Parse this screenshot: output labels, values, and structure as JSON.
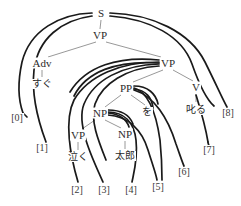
{
  "diagram": {
    "canvas": {
      "width": 241,
      "height": 206
    },
    "colors": {
      "background": "#ffffff",
      "tree_edge": "#8c8c8c",
      "arc": "#1a1a1a",
      "text": "#2b2b2b"
    }
  },
  "nodes": {
    "s": {
      "label": "S",
      "x": 101,
      "y": 13,
      "kind": "category"
    },
    "vp_top": {
      "label": "VP",
      "x": 100,
      "y": 35,
      "kind": "category"
    },
    "adv": {
      "label": "Adv",
      "x": 42,
      "y": 63,
      "kind": "category"
    },
    "vp_right": {
      "label": "VP",
      "x": 168,
      "y": 63,
      "kind": "category"
    },
    "sugu": {
      "label": "すぐ",
      "x": 42,
      "y": 84,
      "kind": "word"
    },
    "v": {
      "label": "V",
      "x": 196,
      "y": 87,
      "kind": "category"
    },
    "pp": {
      "label": "PP",
      "x": 126,
      "y": 88,
      "kind": "category"
    },
    "shikaru": {
      "label": "叱る",
      "x": 196,
      "y": 110,
      "kind": "word"
    },
    "wo": {
      "label": "を",
      "x": 147,
      "y": 112,
      "kind": "word"
    },
    "np_upper": {
      "label": "NP",
      "x": 100,
      "y": 113,
      "kind": "category"
    },
    "vp_low": {
      "label": "VP",
      "x": 78,
      "y": 135,
      "kind": "category"
    },
    "np_lower": {
      "label": "NP",
      "x": 125,
      "y": 134,
      "kind": "category"
    },
    "naku": {
      "label": "泣く",
      "x": 78,
      "y": 157,
      "kind": "word"
    },
    "taro": {
      "label": "太郎",
      "x": 125,
      "y": 156,
      "kind": "word"
    }
  },
  "indices": [
    {
      "label": "[0]",
      "x": 17,
      "y": 118
    },
    {
      "label": "[1]",
      "x": 42,
      "y": 148
    },
    {
      "label": "[2]",
      "x": 77,
      "y": 190
    },
    {
      "label": "[3]",
      "x": 104,
      "y": 190
    },
    {
      "label": "[4]",
      "x": 131,
      "y": 190
    },
    {
      "label": "[5]",
      "x": 158,
      "y": 187
    },
    {
      "label": "[6]",
      "x": 184,
      "y": 172
    },
    {
      "label": "[7]",
      "x": 209,
      "y": 150
    },
    {
      "label": "[8]",
      "x": 228,
      "y": 113
    }
  ],
  "tree_edges": [
    {
      "from": "s",
      "to": "vp_top"
    },
    {
      "from": "vp_top",
      "to": "adv"
    },
    {
      "from": "vp_top",
      "to": "vp_right"
    },
    {
      "from": "adv",
      "to": "sugu"
    },
    {
      "from": "vp_right",
      "to": "pp"
    },
    {
      "from": "vp_right",
      "to": "v"
    },
    {
      "from": "v",
      "to": "shikaru"
    },
    {
      "from": "pp",
      "to": "np_upper"
    },
    {
      "from": "pp",
      "to": "wo"
    },
    {
      "from": "np_upper",
      "to": "vp_low"
    },
    {
      "from": "np_upper",
      "to": "np_lower"
    },
    {
      "from": "vp_low",
      "to": "naku"
    },
    {
      "from": "np_lower",
      "to": "taro"
    }
  ],
  "arcs": [
    {
      "name": "arc-s-0",
      "from_node": "s",
      "to_index": "[0]"
    },
    {
      "name": "arc-s-1",
      "from_node": "s",
      "to_index": "[1]"
    },
    {
      "name": "arc-vp-2",
      "from_node": "vp_right",
      "to_index": "[2]"
    },
    {
      "name": "arc-vp-3",
      "from_node": "vp_right",
      "to_index": "[3]"
    },
    {
      "name": "arc-np-4",
      "from_node": "np_upper",
      "to_index": "[4]"
    },
    {
      "name": "arc-np-5",
      "from_node": "np_upper",
      "to_index": "[5]"
    },
    {
      "name": "arc-pp-6",
      "from_node": "pp",
      "to_index": "[6]"
    },
    {
      "name": "arc-v-7",
      "from_node": "v",
      "to_index": "[7]"
    },
    {
      "name": "arc-s-8",
      "from_node": "s",
      "to_index": "[8]"
    }
  ]
}
